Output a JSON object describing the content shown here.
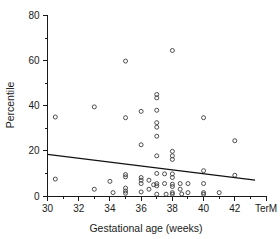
{
  "chart_data": {
    "type": "scatter",
    "title": "",
    "xlabel": "Gestational age (weeks)",
    "ylabel": "Percentile",
    "xlim": [
      30,
      44
    ],
    "ylim": [
      0,
      80
    ],
    "grid": false,
    "legend": null,
    "x_ticks": [
      {
        "value": 30,
        "label": "30",
        "major": true
      },
      {
        "value": 31,
        "label": "",
        "major": false
      },
      {
        "value": 32,
        "label": "32",
        "major": true
      },
      {
        "value": 33,
        "label": "",
        "major": false
      },
      {
        "value": 34,
        "label": "34",
        "major": true
      },
      {
        "value": 35,
        "label": "",
        "major": false
      },
      {
        "value": 36,
        "label": "36",
        "major": true
      },
      {
        "value": 37,
        "label": "",
        "major": false
      },
      {
        "value": 38,
        "label": "38",
        "major": true
      },
      {
        "value": 39,
        "label": "",
        "major": false
      },
      {
        "value": 40,
        "label": "40",
        "major": true
      },
      {
        "value": 41,
        "label": "",
        "major": false
      },
      {
        "value": 42,
        "label": "42",
        "major": true
      },
      {
        "value": 43,
        "label": "",
        "major": false
      },
      {
        "value": 44,
        "label": "TerM",
        "major": true
      }
    ],
    "y_ticks": [
      {
        "value": 0,
        "label": "0",
        "major": true
      },
      {
        "value": 10,
        "label": "",
        "major": false
      },
      {
        "value": 20,
        "label": "20",
        "major": true
      },
      {
        "value": 30,
        "label": "",
        "major": false
      },
      {
        "value": 40,
        "label": "40",
        "major": true
      },
      {
        "value": 50,
        "label": "",
        "major": false
      },
      {
        "value": 60,
        "label": "60",
        "major": true
      },
      {
        "value": 70,
        "label": "",
        "major": false
      },
      {
        "value": 80,
        "label": "80",
        "major": true
      }
    ],
    "marker": "open-circle",
    "points": [
      {
        "x": 30.5,
        "y": 35.0
      },
      {
        "x": 30.5,
        "y": 7.5
      },
      {
        "x": 33.0,
        "y": 39.5
      },
      {
        "x": 33.0,
        "y": 3.0
      },
      {
        "x": 34.0,
        "y": 6.5
      },
      {
        "x": 34.2,
        "y": 1.5
      },
      {
        "x": 35.0,
        "y": 59.8
      },
      {
        "x": 35.0,
        "y": 34.7
      },
      {
        "x": 35.0,
        "y": 9.5
      },
      {
        "x": 35.0,
        "y": 8.5
      },
      {
        "x": 35.0,
        "y": 3.5
      },
      {
        "x": 35.0,
        "y": 2.2
      },
      {
        "x": 35.0,
        "y": 1.2
      },
      {
        "x": 36.0,
        "y": 37.5
      },
      {
        "x": 36.0,
        "y": 22.7
      },
      {
        "x": 36.0,
        "y": 8.2
      },
      {
        "x": 36.0,
        "y": 7.0
      },
      {
        "x": 36.0,
        "y": 5.5
      },
      {
        "x": 36.0,
        "y": 1.8
      },
      {
        "x": 36.5,
        "y": 7.0
      },
      {
        "x": 36.5,
        "y": 3.0
      },
      {
        "x": 36.8,
        "y": 5.0
      },
      {
        "x": 37.0,
        "y": 45.0
      },
      {
        "x": 37.0,
        "y": 43.5
      },
      {
        "x": 37.0,
        "y": 38.0
      },
      {
        "x": 37.0,
        "y": 32.5
      },
      {
        "x": 37.0,
        "y": 30.5
      },
      {
        "x": 37.0,
        "y": 26.5
      },
      {
        "x": 37.0,
        "y": 17.8
      },
      {
        "x": 37.0,
        "y": 10.0
      },
      {
        "x": 37.0,
        "y": 5.5
      },
      {
        "x": 37.0,
        "y": 4.5
      },
      {
        "x": 37.0,
        "y": 0.8
      },
      {
        "x": 37.5,
        "y": 9.8
      },
      {
        "x": 37.5,
        "y": 5.5
      },
      {
        "x": 37.6,
        "y": 0.8
      },
      {
        "x": 38.0,
        "y": 64.5
      },
      {
        "x": 38.0,
        "y": 19.8
      },
      {
        "x": 38.0,
        "y": 17.8
      },
      {
        "x": 38.0,
        "y": 16.2
      },
      {
        "x": 38.0,
        "y": 9.8
      },
      {
        "x": 38.0,
        "y": 8.2
      },
      {
        "x": 38.0,
        "y": 5.2
      },
      {
        "x": 38.0,
        "y": 4.2
      },
      {
        "x": 38.0,
        "y": 1.5
      },
      {
        "x": 38.0,
        "y": 0.8
      },
      {
        "x": 38.5,
        "y": 5.5
      },
      {
        "x": 38.5,
        "y": 3.0
      },
      {
        "x": 38.6,
        "y": 0.9
      },
      {
        "x": 39.0,
        "y": 5.5
      },
      {
        "x": 39.0,
        "y": 1.5
      },
      {
        "x": 40.0,
        "y": 34.7
      },
      {
        "x": 40.0,
        "y": 11.2
      },
      {
        "x": 40.0,
        "y": 5.5
      },
      {
        "x": 40.0,
        "y": 1.5
      },
      {
        "x": 40.0,
        "y": 0.8
      },
      {
        "x": 41.0,
        "y": 1.5
      },
      {
        "x": 42.0,
        "y": 24.5
      },
      {
        "x": 42.0,
        "y": 9.2
      }
    ],
    "trend_line": {
      "x_start": 30.0,
      "y_start": 18.5,
      "x_end": 43.3,
      "y_end": 7.0
    }
  }
}
